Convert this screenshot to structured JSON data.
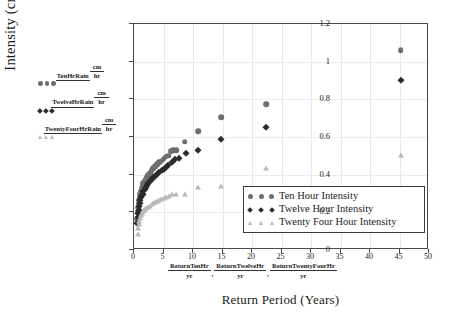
{
  "chart_data": {
    "type": "scatter",
    "title": "",
    "xlabel": "Return Period (Years)",
    "ylabel": "Intensity (cm/hr)",
    "xlim": [
      0,
      50
    ],
    "ylim": [
      0,
      1.2
    ],
    "x_ticks": [
      "0",
      "5",
      "10",
      "15",
      "20",
      "25",
      "30",
      "35",
      "40",
      "45",
      "50"
    ],
    "y_ticks": [
      "0",
      "0.2",
      "0.4",
      "0.6",
      "0.8",
      "1",
      "1.2"
    ],
    "grid": "light vertical and horizontal gridlines",
    "legend_position": "inside lower right",
    "series": [
      {
        "name": "Ten Hour Intensity",
        "marker": "circle",
        "color": "#6e6e6e",
        "points": [
          [
            0.55,
            0.165
          ],
          [
            0.62,
            0.2
          ],
          [
            0.7,
            0.225
          ],
          [
            0.78,
            0.245
          ],
          [
            0.86,
            0.265
          ],
          [
            0.95,
            0.285
          ],
          [
            1.05,
            0.3
          ],
          [
            1.15,
            0.315
          ],
          [
            1.3,
            0.33
          ],
          [
            1.45,
            0.345
          ],
          [
            1.6,
            0.355
          ],
          [
            1.8,
            0.365
          ],
          [
            2.0,
            0.375
          ],
          [
            2.2,
            0.385
          ],
          [
            2.45,
            0.4
          ],
          [
            2.7,
            0.41
          ],
          [
            3.0,
            0.425
          ],
          [
            3.3,
            0.435
          ],
          [
            3.6,
            0.445
          ],
          [
            3.9,
            0.455
          ],
          [
            4.3,
            0.465
          ],
          [
            4.7,
            0.475
          ],
          [
            5.0,
            0.485
          ],
          [
            5.4,
            0.495
          ],
          [
            5.8,
            0.5
          ],
          [
            6.2,
            0.525
          ],
          [
            6.6,
            0.53
          ],
          [
            7.2,
            0.53
          ],
          [
            8.6,
            0.575
          ],
          [
            10.9,
            0.63
          ],
          [
            14.8,
            0.705
          ],
          [
            22.4,
            0.775
          ],
          [
            45.2,
            1.06
          ]
        ]
      },
      {
        "name": "Twelve Hour Intensity",
        "marker": "diamond",
        "color": "#2b2b2b",
        "points": [
          [
            0.55,
            0.145
          ],
          [
            0.62,
            0.175
          ],
          [
            0.7,
            0.195
          ],
          [
            0.78,
            0.215
          ],
          [
            0.86,
            0.235
          ],
          [
            0.95,
            0.25
          ],
          [
            1.05,
            0.265
          ],
          [
            1.15,
            0.28
          ],
          [
            1.3,
            0.29
          ],
          [
            1.45,
            0.3
          ],
          [
            1.6,
            0.315
          ],
          [
            1.8,
            0.325
          ],
          [
            2.0,
            0.335
          ],
          [
            2.2,
            0.345
          ],
          [
            2.45,
            0.355
          ],
          [
            2.7,
            0.365
          ],
          [
            3.0,
            0.375
          ],
          [
            3.3,
            0.385
          ],
          [
            3.6,
            0.395
          ],
          [
            3.9,
            0.405
          ],
          [
            4.3,
            0.415
          ],
          [
            4.7,
            0.425
          ],
          [
            5.0,
            0.43
          ],
          [
            5.4,
            0.44
          ],
          [
            5.8,
            0.45
          ],
          [
            6.4,
            0.465
          ],
          [
            7.0,
            0.485
          ],
          [
            7.6,
            0.49
          ],
          [
            8.8,
            0.515
          ],
          [
            10.9,
            0.53
          ],
          [
            14.8,
            0.59
          ],
          [
            22.4,
            0.655
          ],
          [
            45.2,
            0.905
          ]
        ]
      },
      {
        "name": "Twenty Four Hour Intensity",
        "marker": "triangle",
        "color": "#b8b8b8",
        "points": [
          [
            0.6,
            0.085
          ],
          [
            0.7,
            0.115
          ],
          [
            0.8,
            0.14
          ],
          [
            0.9,
            0.155
          ],
          [
            1.0,
            0.17
          ],
          [
            1.15,
            0.185
          ],
          [
            1.3,
            0.195
          ],
          [
            1.5,
            0.205
          ],
          [
            1.7,
            0.215
          ],
          [
            1.9,
            0.22
          ],
          [
            2.1,
            0.225
          ],
          [
            2.4,
            0.23
          ],
          [
            2.7,
            0.235
          ],
          [
            3.0,
            0.245
          ],
          [
            3.3,
            0.25
          ],
          [
            3.6,
            0.255
          ],
          [
            3.9,
            0.26
          ],
          [
            4.2,
            0.265
          ],
          [
            4.6,
            0.27
          ],
          [
            5.0,
            0.275
          ],
          [
            5.4,
            0.28
          ],
          [
            5.9,
            0.285
          ],
          [
            6.5,
            0.295
          ],
          [
            7.2,
            0.3
          ],
          [
            8.6,
            0.3
          ],
          [
            10.9,
            0.335
          ],
          [
            14.8,
            0.34
          ],
          [
            22.4,
            0.435
          ],
          [
            45.2,
            0.505
          ]
        ]
      }
    ]
  },
  "axis_titles": {
    "y": "Intensity (cm/hr)",
    "x": "Return Period (Years)"
  },
  "series_key": [
    {
      "numerator": "TenHrRain",
      "denominator_num": "cm",
      "denominator_den": "hr",
      "marker": "circle",
      "color": "#6e6e6e"
    },
    {
      "numerator": "TwelveHrRain",
      "denominator_num": "cm",
      "denominator_den": "hr",
      "marker": "diamond",
      "color": "#2b2b2b"
    },
    {
      "numerator": "TwentyFourHrRain",
      "denominator_num": "cm",
      "denominator_den": "hr",
      "marker": "triangle",
      "color": "#b8b8b8"
    }
  ],
  "x_variable_labels": [
    {
      "numerator": "ReturnTenHr",
      "denominator": "yr"
    },
    {
      "numerator": "ReturnTwelveHr",
      "denominator": "yr"
    },
    {
      "numerator": "ReturnTwentyFourHr",
      "denominator": "yr"
    }
  ],
  "x_label_separator": ",",
  "legend": {
    "entries": [
      {
        "label": "Ten Hour Intensity",
        "marker": "circle",
        "color": "#6e6e6e"
      },
      {
        "label": "Twelve Hour Intensity",
        "marker": "diamond",
        "color": "#2b2b2b"
      },
      {
        "label": "Twenty Four Hour Intensity",
        "marker": "triangle",
        "color": "#b8b8b8"
      }
    ]
  },
  "colors": {
    "ten_hour": "#6e6e6e",
    "twelve_hour": "#2b2b2b",
    "twenty_four_hour": "#b8b8b8",
    "frame": "#4a4a4a",
    "grid": "#e8e8e8",
    "background": "#ffffff"
  }
}
